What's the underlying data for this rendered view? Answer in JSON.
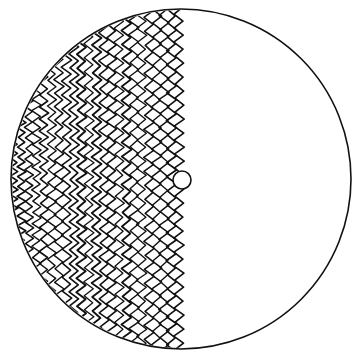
{
  "figure": {
    "colors": {
      "background": "#ffffff",
      "ink": "#111111"
    },
    "outer_circle": {
      "cx": 181,
      "cy": 179,
      "r": 170
    },
    "inner_circle": {
      "cx": 182,
      "cy": 180,
      "r": 9
    },
    "mesh": {
      "x_start": 14,
      "x_end": 186,
      "column_spacing": 7.5,
      "zig_period": 14,
      "zig_amplitude": 4.5
    }
  }
}
